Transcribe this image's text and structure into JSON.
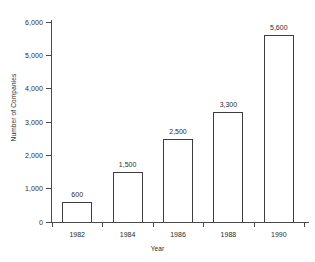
{
  "chart_data": {
    "type": "bar",
    "title": "",
    "xlabel": "Year",
    "ylabel": "Number of Companies",
    "categories": [
      "1982",
      "1984",
      "1986",
      "1988",
      "1990"
    ],
    "values": [
      600,
      1500,
      2500,
      3300,
      5600
    ],
    "value_labels": [
      "600",
      "1,500",
      "2,500",
      "3,300",
      "5,600"
    ],
    "ylim": [
      0,
      6000
    ],
    "ytick_values": [
      0,
      1000,
      2000,
      3000,
      4000,
      5000,
      6000
    ],
    "ytick_labels": [
      "0",
      "1,000",
      "2,000",
      "3,000",
      "4,000",
      "5,000",
      "6,000"
    ],
    "grid": false,
    "legend": false,
    "bar_fill_color": "#ffffff",
    "bar_edge_color": "#3d3d3d",
    "axis_color": "#4a4a4a",
    "text_color": "#2b2b2b",
    "background_color": "#ffffff"
  }
}
